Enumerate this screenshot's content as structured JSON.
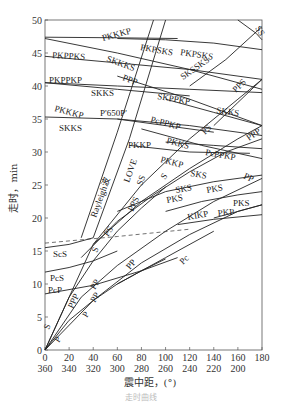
{
  "chart_data": {
    "type": "line",
    "title": "",
    "xlabel": "震中距，(°)",
    "ylabel": "走时，min",
    "xlim": [
      0,
      180
    ],
    "ylim": [
      0,
      50
    ],
    "x_ticks": [
      0,
      20,
      40,
      60,
      80,
      100,
      120,
      140,
      160,
      180
    ],
    "x_ticks_secondary": [
      360,
      340,
      320,
      300,
      280,
      260,
      240,
      220,
      200
    ],
    "y_ticks": [
      0,
      5,
      10,
      15,
      20,
      25,
      30,
      35,
      40,
      45,
      50
    ],
    "grid": false,
    "series": [
      {
        "name": "P",
        "x": [
          0,
          20,
          40,
          60,
          80,
          100
        ],
        "y": [
          0,
          4.5,
          7.5,
          10,
          12,
          13.8
        ]
      },
      {
        "name": "PP",
        "x": [
          0,
          40,
          80,
          120,
          160,
          180
        ],
        "y": [
          0,
          7.5,
          13.2,
          17.5,
          21,
          22
        ]
      },
      {
        "name": "PPP",
        "x": [
          0,
          30,
          60,
          100,
          140,
          180
        ],
        "y": [
          0,
          8,
          12.8,
          18,
          22.5,
          26
        ]
      },
      {
        "name": "S",
        "x": [
          0,
          20,
          40,
          60,
          80,
          100
        ],
        "y": [
          0,
          8,
          13.5,
          18,
          21.5,
          24.7
        ]
      },
      {
        "name": "PS",
        "x": [
          30,
          60,
          90,
          120,
          150,
          180
        ],
        "y": [
          14,
          19.5,
          23.5,
          27,
          30,
          32
        ]
      },
      {
        "name": "PPS",
        "x": [
          40,
          80,
          120,
          160,
          180
        ],
        "y": [
          16,
          22.5,
          27.5,
          32,
          34
        ]
      },
      {
        "name": "SS",
        "x": [
          0,
          40,
          80,
          120,
          160,
          180
        ],
        "y": [
          0,
          16,
          25,
          32,
          38,
          41
        ]
      },
      {
        "name": "ScS",
        "x": [
          0,
          20,
          40
        ],
        "y": [
          15.5,
          16,
          17
        ]
      },
      {
        "name": "PcS",
        "x": [
          0,
          20,
          40,
          60
        ],
        "y": [
          11.8,
          12.5,
          13.5,
          15
        ]
      },
      {
        "name": "PcP",
        "x": [
          0,
          40,
          80,
          110
        ],
        "y": [
          8.5,
          9.8,
          12,
          14
        ]
      },
      {
        "name": "Pc",
        "x": [
          60,
          100,
          140
        ],
        "y": [
          10,
          14,
          18
        ]
      },
      {
        "name": "SKS",
        "x": [
          60,
          100,
          140,
          180
        ],
        "y": [
          21,
          24,
          25.5,
          26.5
        ]
      },
      {
        "name": "PKS",
        "x": [
          100,
          130,
          160,
          180
        ],
        "y": [
          21,
          22.5,
          23.5,
          24
        ]
      },
      {
        "name": "KIKP",
        "x": [
          110,
          140,
          180
        ],
        "y": [
          19,
          19.8,
          20.5
        ]
      },
      {
        "name": "PKP",
        "x": [
          140,
          160,
          180
        ],
        "y": [
          20,
          21,
          22
        ]
      },
      {
        "name": "Rayleigh波",
        "x": [
          30,
          60,
          90
        ],
        "y": [
          17,
          33,
          50
        ]
      },
      {
        "name": "LOVE",
        "x": [
          40,
          70,
          100
        ],
        "y": [
          17,
          32,
          50
        ]
      },
      {
        "name": "PKKP",
        "x": [
          70,
          120,
          170
        ],
        "y": [
          31,
          30,
          29.8
        ]
      },
      {
        "name": "PKKS",
        "x": [
          100,
          140,
          180
        ],
        "y": [
          31.5,
          31,
          30.5
        ]
      },
      {
        "name": "PcPPKP",
        "x": [
          80,
          130,
          180
        ],
        "y": [
          33.5,
          31,
          29
        ]
      },
      {
        "name": "P'650P'",
        "x": [
          60,
          100,
          140
        ],
        "y": [
          35,
          34,
          33
        ]
      },
      {
        "name": "SKKS",
        "x": [
          0,
          60,
          120,
          180
        ],
        "y": [
          35.3,
          35,
          34,
          32.5
        ]
      },
      {
        "name": "SKPPKP",
        "x": [
          100,
          140,
          180
        ],
        "y": [
          38,
          36,
          34
        ]
      },
      {
        "name": "PKKKP",
        "x": [
          0,
          60,
          120
        ],
        "y": [
          40.5,
          39.5,
          38.5
        ]
      },
      {
        "name": "PKPPKP",
        "x": [
          0,
          60,
          120,
          180
        ],
        "y": [
          40.5,
          40,
          39.5,
          39
        ]
      },
      {
        "name": "PPP(upper)",
        "x": [
          60,
          120,
          180
        ],
        "y": [
          41.5,
          38,
          34
        ]
      },
      {
        "name": "SKSSKS",
        "x": [
          120,
          150,
          180
        ],
        "y": [
          40,
          44,
          49
        ]
      },
      {
        "name": "PKPPKS",
        "x": [
          0,
          60,
          120,
          180
        ],
        "y": [
          44.5,
          43.5,
          42.5,
          41
        ]
      },
      {
        "name": "SKKKS",
        "x": [
          0,
          60,
          120,
          180
        ],
        "y": [
          47.2,
          45,
          42.5,
          39.5
        ]
      },
      {
        "name": "PKPSKS",
        "x": [
          60,
          100,
          140,
          180
        ],
        "y": [
          47.2,
          47,
          46.5,
          45.5
        ]
      },
      {
        "name": "PKKKP(upper)",
        "x": [
          0,
          60,
          110
        ],
        "y": [
          47.4,
          47.3,
          47.2
        ]
      },
      {
        "name": "PPS(upper)",
        "x": [
          140,
          160,
          180
        ],
        "y": [
          34,
          37.5,
          41
        ]
      },
      {
        "name": "SS(upper)",
        "x": [
          160,
          175,
          180
        ],
        "y": [
          50,
          48,
          47
        ]
      }
    ],
    "dashed": {
      "name": "ScS-boundary",
      "x": [
        0,
        60,
        120
      ],
      "y": [
        16.2,
        17.2,
        18.3
      ]
    }
  },
  "axes": {
    "ylabel": "走时，min",
    "xlabel": "震中距，(°)",
    "caption": "走时曲线"
  },
  "labels": [
    {
      "text": "PKKKP",
      "x": 103,
      "y": 41,
      "rot": -15
    },
    {
      "text": "PKPSKS",
      "x": 140,
      "y": 50,
      "rot": 10
    },
    {
      "text": "PKPSKS",
      "x": 180,
      "y": 55,
      "rot": 8
    },
    {
      "text": "SS",
      "x": 255,
      "y": 28,
      "rot": 60
    },
    {
      "text": "PKPPKS",
      "x": 52,
      "y": 58,
      "rot": 3
    },
    {
      "text": "SKKKS",
      "x": 106,
      "y": 61,
      "rot": 20
    },
    {
      "text": "SKSSKS",
      "x": 183,
      "y": 80,
      "rot": -35
    },
    {
      "text": "PKPPKP",
      "x": 49,
      "y": 83,
      "rot": 0
    },
    {
      "text": "PPP",
      "x": 122,
      "y": 80,
      "rot": 20
    },
    {
      "text": "SKKS",
      "x": 91,
      "y": 96,
      "rot": 0
    },
    {
      "text": "SKPPKP",
      "x": 157,
      "y": 99,
      "rot": 10
    },
    {
      "text": "PPS",
      "x": 236,
      "y": 93,
      "rot": -45
    },
    {
      "text": "PKKKP",
      "x": 54,
      "y": 111,
      "rot": 15
    },
    {
      "text": "SKKS",
      "x": 216,
      "y": 113,
      "rot": 8
    },
    {
      "text": "P'650P'",
      "x": 100,
      "y": 116,
      "rot": 0
    },
    {
      "text": "PcPPKP",
      "x": 150,
      "y": 122,
      "rot": 15
    },
    {
      "text": "SKKS",
      "x": 59,
      "y": 131,
      "rot": 0
    },
    {
      "text": "PPP",
      "x": 249,
      "y": 141,
      "rot": -35
    },
    {
      "text": "PS",
      "x": 205,
      "y": 135,
      "rot": -45
    },
    {
      "text": "PKKS",
      "x": 166,
      "y": 143,
      "rot": 15
    },
    {
      "text": "PcPPKP",
      "x": 205,
      "y": 155,
      "rot": 10
    },
    {
      "text": "PKKP",
      "x": 128,
      "y": 148,
      "rot": 0
    },
    {
      "text": "PKKP",
      "x": 160,
      "y": 162,
      "rot": 15
    },
    {
      "text": "Rayleigh波",
      "x": 96,
      "y": 218,
      "rot": -70
    },
    {
      "text": "LOVE",
      "x": 129,
      "y": 183,
      "rot": -70
    },
    {
      "text": "SS",
      "x": 142,
      "y": 186,
      "rot": -70
    },
    {
      "text": "PPS",
      "x": 133,
      "y": 212,
      "rot": -65
    },
    {
      "text": "S",
      "x": 165,
      "y": 180,
      "rot": -55
    },
    {
      "text": "SKS",
      "x": 190,
      "y": 176,
      "rot": 10
    },
    {
      "text": "PP",
      "x": 243,
      "y": 178,
      "rot": 25
    },
    {
      "text": "SKS",
      "x": 176,
      "y": 193,
      "rot": -10
    },
    {
      "text": "PKS",
      "x": 167,
      "y": 203,
      "rot": -10
    },
    {
      "text": "PKS",
      "x": 207,
      "y": 193,
      "rot": -10
    },
    {
      "text": "PKS",
      "x": 233,
      "y": 206,
      "rot": 0
    },
    {
      "text": "KIKP",
      "x": 188,
      "y": 220,
      "rot": -10
    },
    {
      "text": "PKP",
      "x": 218,
      "y": 216,
      "rot": -5
    },
    {
      "text": "PS",
      "x": 108,
      "y": 237,
      "rot": -55
    },
    {
      "text": "S",
      "x": 97,
      "y": 253,
      "rot": -70
    },
    {
      "text": "ScS",
      "x": 53,
      "y": 257,
      "rot": 0
    },
    {
      "text": "PcS",
      "x": 50,
      "y": 281,
      "rot": 0
    },
    {
      "text": "PcP",
      "x": 48,
      "y": 293,
      "rot": 0
    },
    {
      "text": "PP",
      "x": 130,
      "y": 270,
      "rot": -50
    },
    {
      "text": "Pc",
      "x": 183,
      "y": 265,
      "rot": -45
    },
    {
      "text": "PP",
      "x": 95,
      "y": 290,
      "rot": -60
    },
    {
      "text": "PPP",
      "x": 73,
      "y": 309,
      "rot": -65
    },
    {
      "text": "PP",
      "x": 95,
      "y": 303,
      "rot": -60
    },
    {
      "text": "P",
      "x": 87,
      "y": 318,
      "rot": -60
    },
    {
      "text": "S",
      "x": 49,
      "y": 330,
      "rot": -70
    },
    {
      "text": "P",
      "x": 59,
      "y": 343,
      "rot": -60
    }
  ]
}
